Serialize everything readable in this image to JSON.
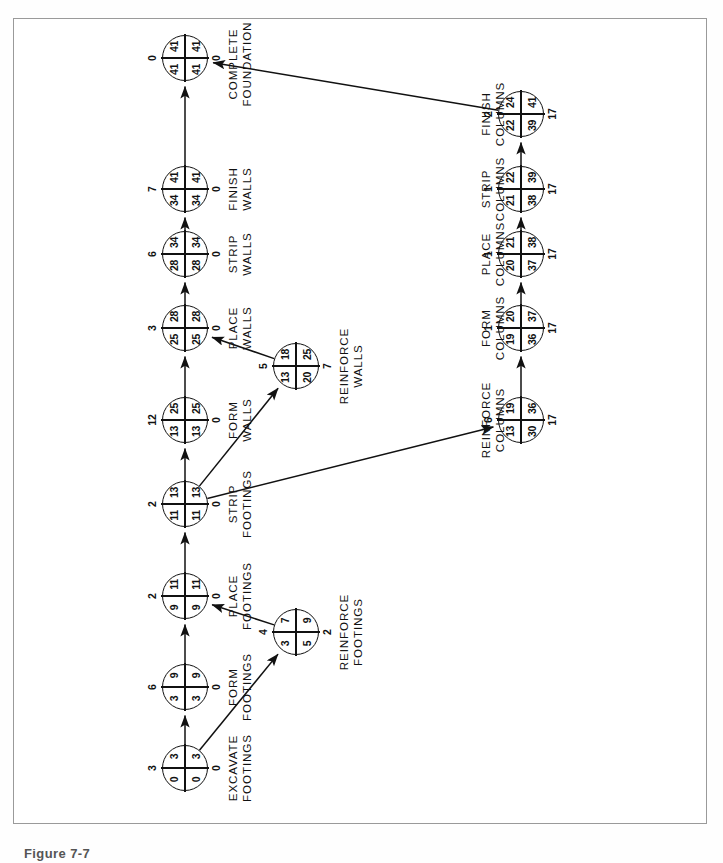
{
  "figure": {
    "caption": "Figure 7-7",
    "orientation": "rotated-90-ccw",
    "colors": {
      "ink": "#111111",
      "frame": "#9a9a9a",
      "paper": "#ffffff"
    }
  },
  "legend": {
    "cell_tl": "Early Start",
    "cell_tr": "Early Finish",
    "cell_bl": "Late Start",
    "cell_br": "Late Finish",
    "above": "Duration",
    "below": "Float"
  },
  "chart_data": {
    "type": "diagram",
    "subtype": "cpm-network",
    "project_duration": 41,
    "critical_path": [
      "excavate-footings",
      "form-footings",
      "place-footings",
      "strip-footings",
      "form-walls",
      "place-walls",
      "strip-walls",
      "finish-walls",
      "complete-foundation"
    ],
    "nodes": [
      {
        "id": "excavate-footings",
        "label": "EXCAVATE\nFOOTINGS",
        "duration": "3",
        "early_start": "0",
        "early_finish": "3",
        "late_start": "0",
        "late_finish": "3",
        "float": "0"
      },
      {
        "id": "form-footings",
        "label": "FORM\nFOOTINGS",
        "duration": "6",
        "early_start": "3",
        "early_finish": "9",
        "late_start": "3",
        "late_finish": "9",
        "float": "0"
      },
      {
        "id": "reinforce-footings",
        "label": "REINFORCE\nFOOTINGS",
        "duration": "4",
        "early_start": "3",
        "early_finish": "7",
        "late_start": "5",
        "late_finish": "9",
        "float": "2"
      },
      {
        "id": "place-footings",
        "label": "PLACE\nFOOTINGS",
        "duration": "2",
        "early_start": "9",
        "early_finish": "11",
        "late_start": "9",
        "late_finish": "11",
        "float": "0"
      },
      {
        "id": "strip-footings",
        "label": "STRIP\nFOOTINGS",
        "duration": "2",
        "early_start": "11",
        "early_finish": "13",
        "late_start": "11",
        "late_finish": "13",
        "float": "0"
      },
      {
        "id": "form-walls",
        "label": "FORM\nWALLS",
        "duration": "12",
        "early_start": "13",
        "early_finish": "25",
        "late_start": "13",
        "late_finish": "25",
        "float": "0"
      },
      {
        "id": "reinforce-walls",
        "label": "REINFORCE\nWALLS",
        "duration": "5",
        "early_start": "13",
        "early_finish": "18",
        "late_start": "20",
        "late_finish": "25",
        "float": "7"
      },
      {
        "id": "place-walls",
        "label": "PLACE\nWALLS",
        "duration": "3",
        "early_start": "25",
        "early_finish": "28",
        "late_start": "25",
        "late_finish": "28",
        "float": "0"
      },
      {
        "id": "strip-walls",
        "label": "STRIP\nWALLS",
        "duration": "6",
        "early_start": "28",
        "early_finish": "34",
        "late_start": "28",
        "late_finish": "34",
        "float": "0"
      },
      {
        "id": "finish-walls",
        "label": "FINISH\nWALLS",
        "duration": "7",
        "early_start": "34",
        "early_finish": "41",
        "late_start": "34",
        "late_finish": "41",
        "float": "0"
      },
      {
        "id": "complete-foundation",
        "label": "COMPLETE\nFOUNDATION",
        "duration": "0",
        "early_start": "41",
        "early_finish": "41",
        "late_start": "41",
        "late_finish": "41",
        "float": "0"
      },
      {
        "id": "reinforce-columns",
        "label": "REINFORCE\nCOLUMNS",
        "duration": "6",
        "early_start": "13",
        "early_finish": "19",
        "late_start": "30",
        "late_finish": "36",
        "float": "17"
      },
      {
        "id": "form-columns",
        "label": "FORM\nCOLUMNS",
        "duration": "1",
        "early_start": "19",
        "early_finish": "20",
        "late_start": "36",
        "late_finish": "37",
        "float": "17"
      },
      {
        "id": "place-columns",
        "label": "PLACE\nCOLUMNS",
        "duration": "1",
        "early_start": "20",
        "early_finish": "21",
        "late_start": "37",
        "late_finish": "38",
        "float": "17"
      },
      {
        "id": "strip-columns",
        "label": "STRIP\nCOLUMNS",
        "duration": "1",
        "early_start": "21",
        "early_finish": "22",
        "late_start": "38",
        "late_finish": "39",
        "float": "17"
      },
      {
        "id": "finish-columns",
        "label": "FINISH\nCOLUMNS",
        "duration": "2",
        "early_start": "22",
        "early_finish": "24",
        "late_start": "39",
        "late_finish": "41",
        "float": "17"
      }
    ],
    "edges": [
      {
        "from": "excavate-footings",
        "to": "form-footings"
      },
      {
        "from": "excavate-footings",
        "to": "reinforce-footings"
      },
      {
        "from": "form-footings",
        "to": "place-footings"
      },
      {
        "from": "reinforce-footings",
        "to": "place-footings"
      },
      {
        "from": "place-footings",
        "to": "strip-footings"
      },
      {
        "from": "strip-footings",
        "to": "form-walls"
      },
      {
        "from": "strip-footings",
        "to": "reinforce-walls"
      },
      {
        "from": "strip-footings",
        "to": "reinforce-columns"
      },
      {
        "from": "form-walls",
        "to": "place-walls"
      },
      {
        "from": "reinforce-walls",
        "to": "place-walls"
      },
      {
        "from": "place-walls",
        "to": "strip-walls"
      },
      {
        "from": "strip-walls",
        "to": "finish-walls"
      },
      {
        "from": "finish-walls",
        "to": "complete-foundation"
      },
      {
        "from": "reinforce-columns",
        "to": "form-columns"
      },
      {
        "from": "form-columns",
        "to": "place-columns"
      },
      {
        "from": "place-columns",
        "to": "strip-columns"
      },
      {
        "from": "strip-columns",
        "to": "finish-columns"
      },
      {
        "from": "finish-columns",
        "to": "complete-foundation"
      }
    ]
  },
  "layout": {
    "nodes": {
      "excavate-footings": {
        "x": 56,
        "y": 172,
        "lx": 56,
        "ly": 213
      },
      "form-footings": {
        "x": 137,
        "y": 172,
        "lx": 137,
        "ly": 213
      },
      "reinforce-footings": {
        "x": 192,
        "y": 283,
        "lx": 192,
        "ly": 324
      },
      "place-footings": {
        "x": 228,
        "y": 172,
        "lx": 228,
        "ly": 213
      },
      "strip-footings": {
        "x": 320,
        "y": 172,
        "lx": 320,
        "ly": 213
      },
      "form-walls": {
        "x": 404,
        "y": 172,
        "lx": 404,
        "ly": 213
      },
      "reinforce-walls": {
        "x": 458,
        "y": 283,
        "lx": 458,
        "ly": 324
      },
      "place-walls": {
        "x": 496,
        "y": 172,
        "lx": 496,
        "ly": 213
      },
      "strip-walls": {
        "x": 570,
        "y": 172,
        "lx": 570,
        "ly": 213
      },
      "finish-walls": {
        "x": 635,
        "y": 172,
        "lx": 635,
        "ly": 213
      },
      "complete-foundation": {
        "x": 766,
        "y": 172,
        "lx": 760,
        "ly": 213
      },
      "reinforce-columns": {
        "x": 404,
        "y": 508,
        "lx": 404,
        "ly": 466
      },
      "form-columns": {
        "x": 496,
        "y": 508,
        "lx": 496,
        "ly": 466
      },
      "place-columns": {
        "x": 570,
        "y": 508,
        "lx": 570,
        "ly": 466
      },
      "strip-columns": {
        "x": 635,
        "y": 508,
        "lx": 635,
        "ly": 466
      },
      "finish-columns": {
        "x": 710,
        "y": 508,
        "lx": 710,
        "ly": 466
      }
    }
  }
}
